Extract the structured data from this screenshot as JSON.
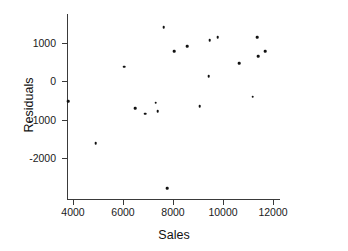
{
  "chart_data": {
    "type": "scatter",
    "title": "",
    "xlabel": "Sales",
    "ylabel": "Residuals",
    "xlim": [
      3300,
      12600
    ],
    "ylim": [
      -3000,
      1700
    ],
    "grid": false,
    "legend": null,
    "xticks": [
      4000,
      6000,
      8000,
      10000,
      12000
    ],
    "xtick_labels": [
      "4000",
      "6000",
      "8000",
      "10000",
      "12000"
    ],
    "yticks": [
      1000,
      0,
      -1000,
      -2000
    ],
    "ytick_labels": [
      "1000",
      "0",
      "-1000",
      "-2000"
    ],
    "marker": "filled-circle",
    "marker_color": "#111111",
    "axis_color": "#3a3a3a",
    "background_color": "#ffffff",
    "points": [
      {
        "x": 3800,
        "y": -530
      },
      {
        "x": 4900,
        "y": -1610
      },
      {
        "x": 6050,
        "y": 370
      },
      {
        "x": 6480,
        "y": -700
      },
      {
        "x": 6880,
        "y": -850
      },
      {
        "x": 7300,
        "y": -560
      },
      {
        "x": 7380,
        "y": -790
      },
      {
        "x": 7620,
        "y": 1400
      },
      {
        "x": 7760,
        "y": -2780
      },
      {
        "x": 8050,
        "y": 780
      },
      {
        "x": 8560,
        "y": 900
      },
      {
        "x": 9070,
        "y": -660
      },
      {
        "x": 9420,
        "y": 120
      },
      {
        "x": 9460,
        "y": 1060
      },
      {
        "x": 9780,
        "y": 1140
      },
      {
        "x": 10640,
        "y": 460
      },
      {
        "x": 11180,
        "y": -410
      },
      {
        "x": 11370,
        "y": 1130
      },
      {
        "x": 11400,
        "y": 650
      },
      {
        "x": 11680,
        "y": 780
      }
    ]
  }
}
